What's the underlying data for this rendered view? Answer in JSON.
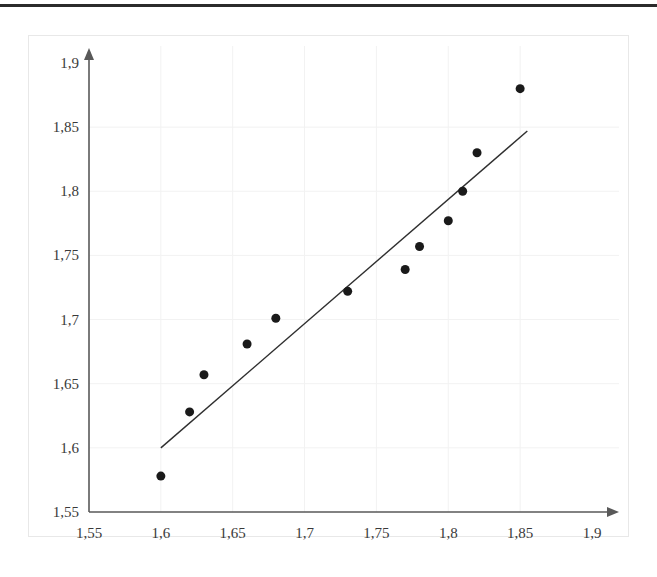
{
  "chart_data": {
    "type": "scatter",
    "title": "",
    "xlabel": "",
    "ylabel": "",
    "xlim": [
      1.55,
      1.9
    ],
    "ylim": [
      1.55,
      1.9
    ],
    "grid": true,
    "legend": "none",
    "decimal_separator": ",",
    "x_tick_labels": [
      "1,55",
      "1,6",
      "1,65",
      "1,7",
      "1,75",
      "1,8",
      "1,85",
      "1,9"
    ],
    "x_tick_values": [
      1.55,
      1.6,
      1.65,
      1.7,
      1.75,
      1.8,
      1.85,
      1.9
    ],
    "y_tick_labels": [
      "1,55",
      "1,6",
      "1,65",
      "1,7",
      "1,75",
      "1,8",
      "1,85",
      "1,9"
    ],
    "y_tick_values": [
      1.55,
      1.6,
      1.65,
      1.7,
      1.75,
      1.8,
      1.85,
      1.9
    ],
    "series": [
      {
        "name": "data-points",
        "type": "scatter",
        "marker": "circle",
        "color": "#1a1a1a",
        "marker_size": 9,
        "points": [
          {
            "x": 1.6,
            "y": 1.578
          },
          {
            "x": 1.62,
            "y": 1.628
          },
          {
            "x": 1.63,
            "y": 1.657
          },
          {
            "x": 1.66,
            "y": 1.681
          },
          {
            "x": 1.68,
            "y": 1.701
          },
          {
            "x": 1.73,
            "y": 1.722
          },
          {
            "x": 1.77,
            "y": 1.739
          },
          {
            "x": 1.78,
            "y": 1.757
          },
          {
            "x": 1.8,
            "y": 1.777
          },
          {
            "x": 1.81,
            "y": 1.8
          },
          {
            "x": 1.82,
            "y": 1.83
          },
          {
            "x": 1.85,
            "y": 1.88
          }
        ]
      },
      {
        "name": "trend-line",
        "type": "line",
        "color": "#2f2f2f",
        "line_width": 1.4,
        "points": [
          {
            "x": 1.6,
            "y": 1.6
          },
          {
            "x": 1.855,
            "y": 1.847
          }
        ]
      }
    ],
    "axis_style": {
      "color": "#595959",
      "arrow_heads": true,
      "x_axis_at": 1.55,
      "y_axis_at": 1.55
    },
    "gridlines": {
      "color": "#f2f2f2",
      "x_at": [
        1.6,
        1.65,
        1.7,
        1.75,
        1.8,
        1.85
      ],
      "y_at": [
        1.6,
        1.65,
        1.7,
        1.75,
        1.8,
        1.85
      ]
    }
  }
}
